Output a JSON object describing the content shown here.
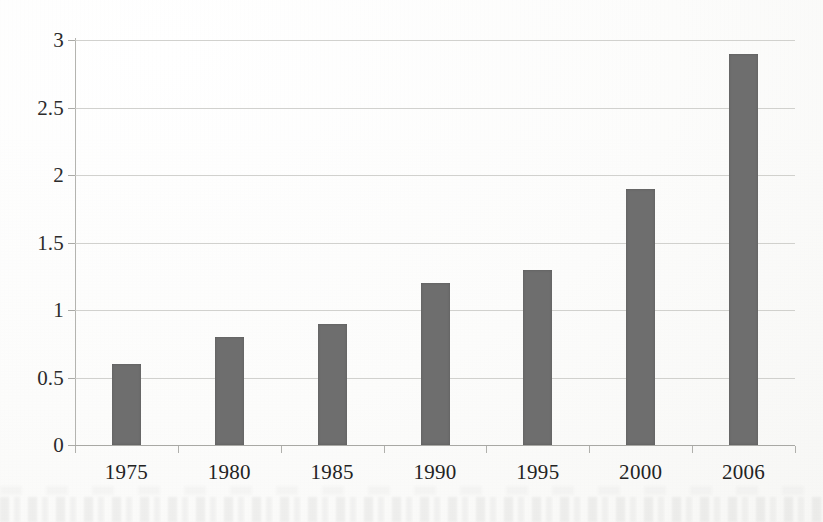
{
  "chart_data": {
    "type": "bar",
    "title": "",
    "subtitle": "",
    "xlabel": "",
    "ylabel": "",
    "categories": [
      "1975",
      "1980",
      "1985",
      "1990",
      "1995",
      "2000",
      "2006"
    ],
    "values": [
      0.6,
      0.8,
      0.9,
      1.2,
      1.3,
      1.9,
      2.9
    ],
    "series": [
      {
        "name": "",
        "values": [
          0.6,
          0.8,
          0.9,
          1.2,
          1.3,
          1.9,
          2.9
        ]
      }
    ],
    "ylim": [
      0,
      3
    ],
    "ytick_labels": [
      "0",
      "0.5",
      "1",
      "1.5",
      "2",
      "2.5",
      "3"
    ],
    "ytick_values": [
      0,
      0.5,
      1,
      1.5,
      2,
      2.5,
      3
    ],
    "grid": true,
    "grid_axis": "y",
    "legend": false,
    "legend_position": "none",
    "annotations": [],
    "colors": {
      "bar": "#6e6e6e",
      "gridline": "#c9c9c6",
      "axis": "#b4b4b0",
      "text": "#232323",
      "background": "#fdfdfc"
    }
  }
}
